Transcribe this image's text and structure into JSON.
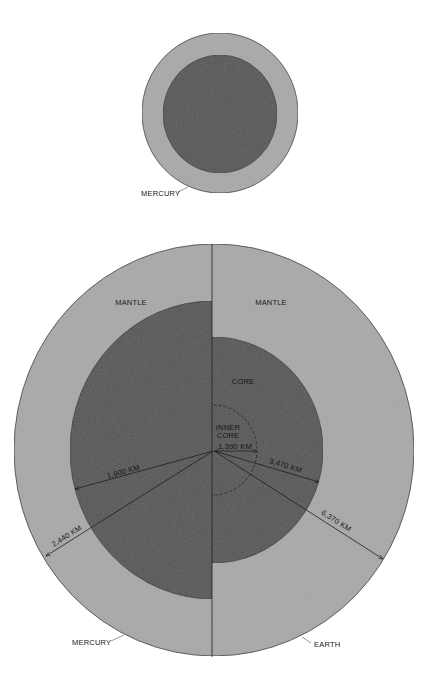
{
  "colors": {
    "mantle": "#a9a9a9",
    "core": "#565656",
    "outline": "#3a3a3a",
    "line": "#1e1e1e",
    "background": "#ffffff"
  },
  "small_diagram": {
    "planet_label": "MERCURY"
  },
  "comparison_diagram": {
    "left_half": {
      "planet_label": "MERCURY",
      "layer_label": "MANTLE",
      "core_radius_label": "1,900 KM",
      "planet_radius_label": "2,440 KM"
    },
    "right_half": {
      "planet_label": "EARTH",
      "layer_label": "MANTLE",
      "core_label": "CORE",
      "inner_core_label_line1": "INNER",
      "inner_core_label_line2": "CORE",
      "inner_core_radius_label": "1,390 KM",
      "core_radius_label": "3,470 KM",
      "planet_radius_label": "6,370 KM"
    }
  }
}
